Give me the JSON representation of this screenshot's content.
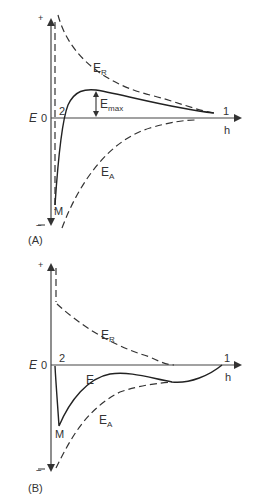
{
  "panels": [
    {
      "id": "A",
      "caption": "(A)",
      "y_axis": {
        "label": "E",
        "zero": "0",
        "plus": "+",
        "minus": "−"
      },
      "x_axis": {
        "label": "h"
      },
      "points": {
        "point_1": "1",
        "point_2": "2",
        "minimum": "M"
      },
      "curves": {
        "repulsion": {
          "label": "E",
          "sub": "R",
          "style": "dashed"
        },
        "attraction": {
          "label": "E",
          "sub": "A",
          "style": "dashed"
        },
        "total": {
          "style": "solid"
        }
      },
      "barrier": {
        "label": "E",
        "sub": "max"
      }
    },
    {
      "id": "B",
      "caption": "(B)",
      "y_axis": {
        "label": "E",
        "zero": "0",
        "plus": "+",
        "minus": "−"
      },
      "x_axis": {
        "label": "h"
      },
      "points": {
        "point_1": "1",
        "point_2": "2",
        "minimum": "M"
      },
      "curves": {
        "repulsion": {
          "label": "E",
          "sub": "R",
          "style": "dashed"
        },
        "attraction": {
          "label": "E",
          "sub": "A",
          "style": "dashed"
        },
        "total": {
          "label": "E",
          "style": "solid"
        }
      }
    }
  ]
}
